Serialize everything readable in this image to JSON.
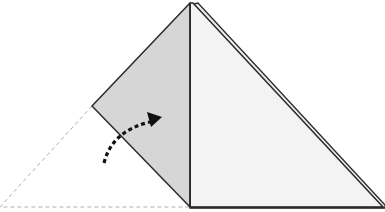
{
  "diagram": {
    "title": "Origami fold step: fold left flap over to the right",
    "colors": {
      "background": "#ffffff",
      "flap_fill": "#d6d6d6",
      "front_fill": "#f3f3f3",
      "outline": "#2a2a2a",
      "dashed_guide": "#b0b0b0",
      "arrow": "#111111"
    },
    "elements": {
      "folded_flap": {
        "label": "folded-flap",
        "points": [
          [
            190,
            3
          ],
          [
            92,
            106
          ],
          [
            190,
            207
          ]
        ]
      },
      "front_triangle": {
        "label": "front-triangle",
        "points": [
          [
            190,
            3
          ],
          [
            190,
            207
          ],
          [
            383,
            207
          ]
        ]
      },
      "back_layer_edge": {
        "label": "back-layer-edge",
        "from": [
          196,
          3
        ],
        "to": [
          385,
          204
        ]
      },
      "original_position": {
        "label": "original-position-outline",
        "points": [
          [
            92,
            106
          ],
          [
            0,
            207
          ],
          [
            190,
            207
          ]
        ]
      },
      "fold_arrow": {
        "label": "fold-direction-arrow",
        "start": [
          103,
          163
        ],
        "tip": [
          161,
          117
        ]
      }
    }
  }
}
